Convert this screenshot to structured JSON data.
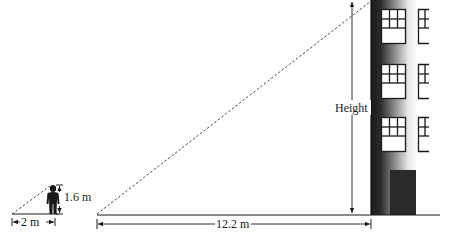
{
  "diagram": {
    "person": {
      "height_label": "1.6 m",
      "shadow_label": "2 m"
    },
    "building": {
      "height_label": "Height",
      "shadow_label": "12.2 m",
      "windows_rows": 3,
      "has_door": true
    },
    "colors": {
      "ink": "#1a1a1a",
      "building_dark": "#1e1e1e",
      "door": "#2a2a2a",
      "background": "#ffffff"
    }
  }
}
